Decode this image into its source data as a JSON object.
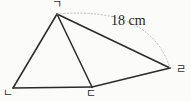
{
  "figure": {
    "type": "geometry-diagram",
    "shape": "quadrilateral-with-diagonal",
    "background_color": "#fbfbfa",
    "stroke_color": "#2a2a2a",
    "dashed_stroke_color": "#b9b9b9",
    "vertices": [
      {
        "id": "g",
        "label": "ㄱ",
        "x": 57,
        "y": 14
      },
      {
        "id": "n",
        "label": "ㄴ",
        "x": 13,
        "y": 88
      },
      {
        "id": "d",
        "label": "ㄷ",
        "x": 92,
        "y": 87
      },
      {
        "id": "r",
        "label": "ㄹ",
        "x": 170,
        "y": 68
      }
    ],
    "solid_edges": [
      {
        "from": "g",
        "to": "n"
      },
      {
        "from": "g",
        "to": "d"
      },
      {
        "from": "g",
        "to": "r"
      },
      {
        "from": "n",
        "to": "d"
      },
      {
        "from": "d",
        "to": "r"
      }
    ],
    "dashed_arc": {
      "from": "g",
      "to": "r",
      "control_x": 150,
      "control_y": 6,
      "style": "dotted"
    },
    "measurements": [
      {
        "id": "arc-length",
        "text": "18 cm",
        "value": 18,
        "unit": "cm",
        "x": 111,
        "y": 14
      }
    ]
  }
}
